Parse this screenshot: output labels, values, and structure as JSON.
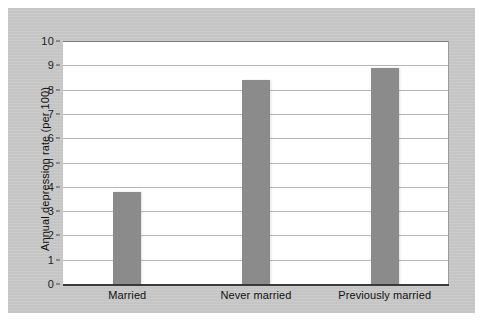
{
  "chart_data": {
    "type": "bar",
    "title": "",
    "subtitle": "",
    "xlabel": "",
    "ylabel": "Annual depression rate (per 100)",
    "categories": [
      "Married",
      "Never married",
      "Previously married"
    ],
    "values": [
      3.8,
      8.4,
      8.9
    ],
    "series": [
      {
        "name": "Annual depression rate",
        "values": [
          3.8,
          8.4,
          8.9
        ]
      }
    ],
    "ylim": [
      0,
      10
    ],
    "y_ticks": [
      0,
      1,
      2,
      3,
      4,
      5,
      6,
      7,
      8,
      9,
      10
    ],
    "y_tick_labels": [
      "0",
      "1",
      "2",
      "3",
      "4",
      "5",
      "6",
      "7",
      "8",
      "9",
      "10"
    ],
    "grid": true,
    "grid_axis": "y",
    "legend": false,
    "legend_position": "none",
    "annotations": [],
    "bar_color": "#8b8b8b",
    "gridline_color": "#b5b5b5",
    "axis_color": "#2e2e2e",
    "plot_background": "#ffffff",
    "figure_background": "#c9c9c9"
  }
}
